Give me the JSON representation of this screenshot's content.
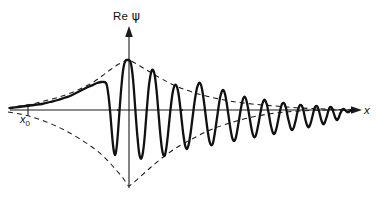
{
  "figure": {
    "title_label": "Re",
    "psi_symbol": "ψ",
    "x_axis_label": "x",
    "x0_label": "x",
    "x0_subscript": "0",
    "colors": {
      "curve": "#111111",
      "axis": "#1a1a1a",
      "envelope": "#1a1a1a",
      "background": "#ffffff"
    }
  },
  "chart_data": {
    "type": "line",
    "title": "Re ψ",
    "xlabel": "x",
    "ylabel": "Re ψ",
    "grid": false,
    "legend": "none",
    "annotations": [
      {
        "text": "x₀",
        "x": 28,
        "y": 110,
        "kind": "axis-tick-label"
      },
      {
        "text": "Re ψ",
        "x": 129,
        "y": 14,
        "kind": "axis-label"
      },
      {
        "text": "x",
        "x": 366,
        "y": 110,
        "kind": "axis-label"
      }
    ],
    "axes": {
      "origin_px": [
        129,
        110
      ],
      "x_axis_px": [
        10,
        110,
        362,
        110
      ],
      "y_axis_px": [
        129,
        188,
        129,
        28
      ]
    },
    "series": [
      {
        "name": "Re psi wave packet",
        "style": "solid",
        "points_px": [
          [
            10,
            108
          ],
          [
            18,
            107
          ],
          [
            26,
            106
          ],
          [
            34,
            105
          ],
          [
            42,
            104
          ],
          [
            50,
            102
          ],
          [
            58,
            100
          ],
          [
            64,
            98
          ],
          [
            70,
            96
          ],
          [
            76,
            93
          ],
          [
            82,
            90
          ],
          [
            88,
            87
          ],
          [
            93,
            85
          ],
          [
            97,
            83
          ],
          [
            101,
            82
          ],
          [
            104,
            82
          ],
          [
            106,
            83
          ],
          [
            107,
            86
          ],
          [
            108,
            92
          ],
          [
            109,
            100
          ],
          [
            110,
            110
          ],
          [
            111,
            122
          ],
          [
            112,
            134
          ],
          [
            113,
            145
          ],
          [
            114,
            152
          ],
          [
            115,
            155
          ],
          [
            116,
            152
          ],
          [
            117,
            144
          ],
          [
            118,
            132
          ],
          [
            119,
            118
          ],
          [
            120,
            104
          ],
          [
            121,
            91
          ],
          [
            122,
            80
          ],
          [
            123,
            71
          ],
          [
            124,
            65
          ],
          [
            125,
            62
          ],
          [
            126,
            60
          ],
          [
            127,
            60
          ],
          [
            128,
            60
          ],
          [
            129,
            60
          ],
          [
            130,
            61
          ],
          [
            131,
            64
          ],
          [
            132,
            70
          ],
          [
            133,
            79
          ],
          [
            134,
            91
          ],
          [
            135,
            105
          ],
          [
            136,
            119
          ],
          [
            137,
            132
          ],
          [
            138,
            143
          ],
          [
            139,
            152
          ],
          [
            140,
            157
          ],
          [
            141,
            159
          ],
          [
            142,
            157
          ],
          [
            143,
            152
          ],
          [
            144,
            144
          ],
          [
            145,
            133
          ],
          [
            146,
            120
          ],
          [
            147,
            107
          ],
          [
            148,
            95
          ],
          [
            149,
            85
          ],
          [
            150,
            78
          ],
          [
            151,
            73
          ],
          [
            152,
            70
          ],
          [
            153,
            70
          ],
          [
            154,
            72
          ],
          [
            155,
            77
          ],
          [
            156,
            85
          ],
          [
            157,
            95
          ],
          [
            158,
            107
          ],
          [
            159,
            119
          ],
          [
            160,
            131
          ],
          [
            161,
            141
          ],
          [
            162,
            149
          ],
          [
            163,
            154
          ],
          [
            164,
            156
          ],
          [
            165,
            155
          ],
          [
            166,
            150
          ],
          [
            167,
            143
          ],
          [
            168,
            134
          ],
          [
            169,
            124
          ],
          [
            170,
            114
          ],
          [
            171,
            105
          ],
          [
            172,
            97
          ],
          [
            173,
            91
          ],
          [
            174,
            87
          ],
          [
            175,
            85
          ],
          [
            176,
            85
          ],
          [
            177,
            87
          ],
          [
            178,
            91
          ],
          [
            179,
            97
          ],
          [
            180,
            105
          ],
          [
            181,
            114
          ],
          [
            182,
            123
          ],
          [
            183,
            132
          ],
          [
            184,
            139
          ],
          [
            185,
            145
          ],
          [
            186,
            148
          ],
          [
            187,
            149
          ],
          [
            188,
            147
          ],
          [
            189,
            143
          ],
          [
            190,
            137
          ],
          [
            191,
            130
          ],
          [
            192,
            122
          ],
          [
            193,
            114
          ],
          [
            194,
            106
          ],
          [
            195,
            99
          ],
          [
            196,
            93
          ],
          [
            197,
            88
          ],
          [
            198,
            85
          ],
          [
            199,
            83
          ],
          [
            200,
            83
          ],
          [
            201,
            85
          ],
          [
            202,
            89
          ],
          [
            203,
            95
          ],
          [
            204,
            102
          ],
          [
            205,
            110
          ],
          [
            206,
            118
          ],
          [
            207,
            126
          ],
          [
            208,
            133
          ],
          [
            209,
            139
          ],
          [
            210,
            143
          ],
          [
            211,
            145
          ],
          [
            212,
            145
          ],
          [
            213,
            143
          ],
          [
            214,
            138
          ],
          [
            215,
            132
          ],
          [
            216,
            125
          ],
          [
            217,
            118
          ],
          [
            218,
            111
          ],
          [
            219,
            104
          ],
          [
            220,
            98
          ],
          [
            221,
            94
          ],
          [
            222,
            91
          ],
          [
            223,
            90
          ],
          [
            224,
            91
          ],
          [
            225,
            94
          ],
          [
            226,
            99
          ],
          [
            227,
            105
          ],
          [
            228,
            112
          ],
          [
            229,
            119
          ],
          [
            230,
            126
          ],
          [
            231,
            132
          ],
          [
            232,
            137
          ],
          [
            233,
            140
          ],
          [
            234,
            141
          ],
          [
            235,
            140
          ],
          [
            236,
            137
          ],
          [
            237,
            132
          ],
          [
            238,
            126
          ],
          [
            239,
            120
          ],
          [
            240,
            114
          ],
          [
            241,
            108
          ],
          [
            242,
            103
          ],
          [
            243,
            99
          ],
          [
            244,
            97
          ],
          [
            245,
            97
          ],
          [
            246,
            99
          ],
          [
            247,
            103
          ],
          [
            248,
            108
          ],
          [
            249,
            114
          ],
          [
            250,
            120
          ],
          [
            251,
            126
          ],
          [
            252,
            131
          ],
          [
            253,
            135
          ],
          [
            254,
            137
          ],
          [
            255,
            137
          ],
          [
            256,
            135
          ],
          [
            257,
            131
          ],
          [
            258,
            126
          ],
          [
            259,
            121
          ],
          [
            260,
            115
          ],
          [
            261,
            110
          ],
          [
            262,
            105
          ],
          [
            263,
            102
          ],
          [
            264,
            100
          ],
          [
            265,
            100
          ],
          [
            266,
            102
          ],
          [
            267,
            105
          ],
          [
            268,
            110
          ],
          [
            269,
            115
          ],
          [
            270,
            121
          ],
          [
            271,
            126
          ],
          [
            272,
            130
          ],
          [
            273,
            133
          ],
          [
            274,
            134
          ],
          [
            275,
            133
          ],
          [
            276,
            130
          ],
          [
            277,
            126
          ],
          [
            278,
            121
          ],
          [
            279,
            116
          ],
          [
            280,
            111
          ],
          [
            281,
            107
          ],
          [
            282,
            104
          ],
          [
            283,
            103
          ],
          [
            284,
            103
          ],
          [
            285,
            105
          ],
          [
            286,
            108
          ],
          [
            287,
            113
          ],
          [
            288,
            118
          ],
          [
            289,
            122
          ],
          [
            290,
            126
          ],
          [
            291,
            129
          ],
          [
            292,
            130
          ],
          [
            293,
            129
          ],
          [
            294,
            127
          ],
          [
            295,
            123
          ],
          [
            296,
            119
          ],
          [
            297,
            114
          ],
          [
            298,
            110
          ],
          [
            299,
            107
          ],
          [
            300,
            105
          ],
          [
            301,
            105
          ],
          [
            302,
            106
          ],
          [
            303,
            109
          ],
          [
            304,
            113
          ],
          [
            305,
            118
          ],
          [
            306,
            122
          ],
          [
            307,
            125
          ],
          [
            308,
            127
          ],
          [
            309,
            127
          ],
          [
            310,
            125
          ],
          [
            311,
            122
          ],
          [
            312,
            118
          ],
          [
            313,
            114
          ],
          [
            314,
            110
          ],
          [
            315,
            107
          ],
          [
            316,
            106
          ],
          [
            317,
            106
          ],
          [
            318,
            108
          ],
          [
            319,
            111
          ],
          [
            320,
            115
          ],
          [
            321,
            119
          ],
          [
            322,
            122
          ],
          [
            323,
            124
          ],
          [
            324,
            124
          ],
          [
            325,
            122
          ],
          [
            326,
            119
          ],
          [
            327,
            116
          ],
          [
            328,
            112
          ],
          [
            329,
            109
          ],
          [
            330,
            107
          ],
          [
            331,
            107
          ],
          [
            332,
            108
          ],
          [
            333,
            111
          ],
          [
            334,
            114
          ],
          [
            335,
            117
          ],
          [
            336,
            119
          ],
          [
            337,
            120
          ],
          [
            338,
            119
          ],
          [
            339,
            117
          ],
          [
            340,
            114
          ],
          [
            341,
            112
          ],
          [
            342,
            110
          ],
          [
            343,
            109
          ],
          [
            344,
            109
          ],
          [
            345,
            110
          ],
          [
            346,
            111
          ],
          [
            347,
            112
          ],
          [
            348,
            112
          ],
          [
            349,
            112
          ],
          [
            350,
            111
          ],
          [
            351,
            110
          ],
          [
            352,
            110
          ],
          [
            353,
            110
          ]
        ]
      },
      {
        "name": "upper envelope",
        "style": "dashed",
        "points_px": [
          [
            8,
            108
          ],
          [
            20,
            106
          ],
          [
            32,
            104
          ],
          [
            44,
            101
          ],
          [
            56,
            98
          ],
          [
            68,
            94
          ],
          [
            80,
            89
          ],
          [
            92,
            83
          ],
          [
            102,
            76
          ],
          [
            110,
            70
          ],
          [
            117,
            65
          ],
          [
            123,
            62
          ],
          [
            127,
            60
          ],
          [
            129,
            60
          ],
          [
            133,
            62
          ],
          [
            140,
            66
          ],
          [
            150,
            72
          ],
          [
            162,
            79
          ],
          [
            176,
            86
          ],
          [
            192,
            92
          ],
          [
            210,
            97
          ],
          [
            230,
            101
          ],
          [
            252,
            104
          ],
          [
            276,
            106
          ],
          [
            300,
            108
          ],
          [
            326,
            109
          ],
          [
            352,
            110
          ]
        ]
      },
      {
        "name": "lower envelope",
        "style": "dashed",
        "points_px": [
          [
            8,
            112
          ],
          [
            20,
            114
          ],
          [
            32,
            117
          ],
          [
            44,
            121
          ],
          [
            56,
            126
          ],
          [
            68,
            132
          ],
          [
            80,
            139
          ],
          [
            92,
            147
          ],
          [
            102,
            155
          ],
          [
            110,
            163
          ],
          [
            117,
            171
          ],
          [
            123,
            178
          ],
          [
            127,
            184
          ],
          [
            129,
            186
          ],
          [
            133,
            183
          ],
          [
            140,
            177
          ],
          [
            150,
            168
          ],
          [
            162,
            158
          ],
          [
            176,
            148
          ],
          [
            192,
            139
          ],
          [
            210,
            130
          ],
          [
            230,
            123
          ],
          [
            252,
            117
          ],
          [
            276,
            113
          ],
          [
            300,
            111
          ],
          [
            326,
            110
          ],
          [
            352,
            110
          ]
        ]
      }
    ]
  }
}
